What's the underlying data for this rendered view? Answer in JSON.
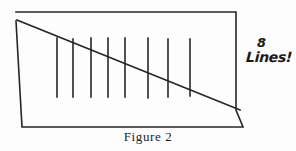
{
  "figure": {
    "caption": "Figure 2",
    "annotation": {
      "count": "8",
      "word": "Lines!"
    },
    "ink_color": "#262626",
    "background_color": "#fdfdfd",
    "stroke_width": 1.6,
    "outline": {
      "name": "quadrilateral-outline",
      "points": "16,12 236,12 236,110 243,127 22,127 16,21",
      "description": "hand-drawn four-sided box with slightly ragged corners"
    },
    "diagonal": {
      "name": "diagonal-line",
      "x1": 17,
      "y1": 20,
      "x2": 240,
      "y2": 110
    },
    "tick_lines": [
      {
        "label": "line-1",
        "x": 57,
        "y_top": 38,
        "y_bottom": 97
      },
      {
        "label": "line-2",
        "x": 73,
        "y_top": 39,
        "y_bottom": 97
      },
      {
        "label": "line-3",
        "x": 91,
        "y_top": 38,
        "y_bottom": 97
      },
      {
        "label": "line-4",
        "x": 108,
        "y_top": 38,
        "y_bottom": 97
      },
      {
        "label": "line-5",
        "x": 125,
        "y_top": 38,
        "y_bottom": 97
      },
      {
        "label": "line-6",
        "x": 148,
        "y_top": 38,
        "y_bottom": 98
      },
      {
        "label": "line-7",
        "x": 168,
        "y_top": 39,
        "y_bottom": 97
      },
      {
        "label": "line-8",
        "x": 190,
        "y_top": 39,
        "y_bottom": 96
      }
    ]
  }
}
